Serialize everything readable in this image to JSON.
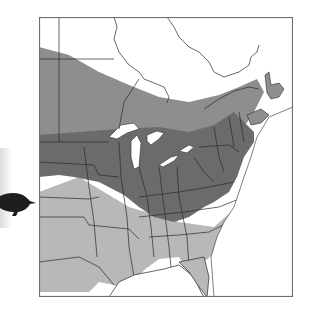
{
  "figure": {
    "type": "species-range-map",
    "region": "Eastern North America",
    "caption": "Range map with bird silhouette"
  },
  "legend": {
    "items": [
      {
        "label": "Breeding range",
        "color": "#8e8e8e"
      },
      {
        "label": "Year-round range",
        "color": "#6b6b6b"
      },
      {
        "label": "Winter range",
        "color": "#b8b8b8"
      }
    ]
  },
  "colors": {
    "land_outside_range": "#ffffff",
    "water": "#ffffff",
    "borders": "#2a2a2a",
    "frame": "#6e6e6e",
    "bird": "#1e1e1e"
  },
  "bird": {
    "icon": "bird-silhouette-icon",
    "facing": "right"
  }
}
